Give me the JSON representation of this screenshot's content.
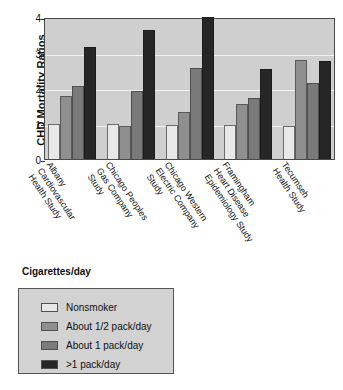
{
  "chart_data": {
    "type": "bar",
    "title": "",
    "xlabel": "",
    "ylabel": "CHD Mortality Ratios",
    "ylim": [
      0,
      4
    ],
    "yticks": [
      "0",
      "1",
      "2",
      "3",
      "4"
    ],
    "grid": true,
    "legend_position": "below-plot",
    "legend_title": "Cigarettes/day",
    "categories": [
      "Albany Cardiovascular Health Study",
      "Chicago Peoples Gas Company Study",
      "Chicago Western Electric Company Study",
      "Framingham Heart Disease Epidemiology Study",
      "Tecumseh Health Study"
    ],
    "category_lines": [
      [
        "Albany",
        "Cardiovascular",
        "Health Study"
      ],
      [
        "Chicago Peoples",
        "Gas Company",
        "Study"
      ],
      [
        "Chicago Western",
        "Electric Company",
        "Study"
      ],
      [
        "Framingham",
        "Heart Disease",
        "Epidemiology Study"
      ],
      [
        "Tecumseh",
        "Health Study"
      ]
    ],
    "series": [
      {
        "name": "Nonsmoker",
        "color": "#e8e8e8",
        "values": [
          1.0,
          1.0,
          0.97,
          0.95,
          0.93
        ]
      },
      {
        "name": "About 1/2 pack/day",
        "color": "#8f8f8f",
        "values": [
          1.78,
          0.93,
          1.32,
          1.55,
          2.8
        ]
      },
      {
        "name": "About 1 pack/day",
        "color": "#7a7a7a",
        "values": [
          2.05,
          1.91,
          2.57,
          1.72,
          2.14
        ]
      },
      {
        "name": ">1 pack/day",
        "color": "#262626",
        "values": [
          3.15,
          3.63,
          4.0,
          2.53,
          2.77
        ]
      }
    ]
  },
  "legend": {
    "title": "Cigarettes/day",
    "items": [
      {
        "label": "Nonsmoker"
      },
      {
        "label": "About 1/2 pack/day"
      },
      {
        "label": "About 1 pack/day"
      },
      {
        "label": ">1 pack/day"
      }
    ]
  }
}
